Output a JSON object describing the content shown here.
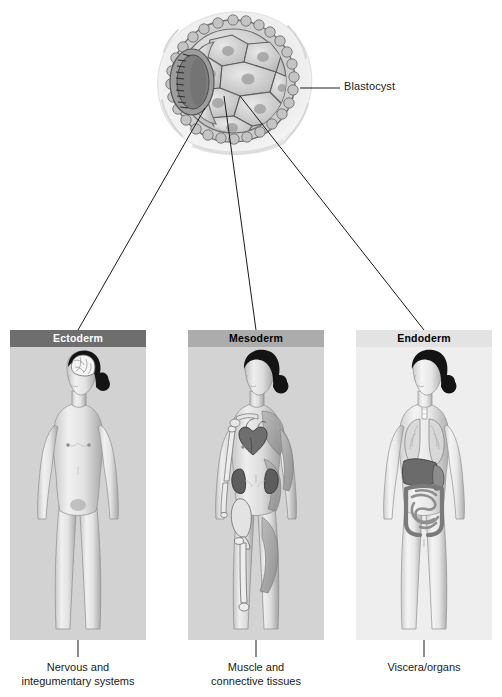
{
  "figure": {
    "background_color": "#ffffff"
  },
  "blastocyst": {
    "label": "Blastocyst",
    "icon": "blastocyst-illustration",
    "structures": [
      "trophoblast",
      "inner cell mass",
      "bilaminar embryonic disc",
      "blastocyst cavity"
    ]
  },
  "germ_layers": [
    {
      "id": "ectoderm",
      "header": "Ectoderm",
      "header_color": "#6e6e6e",
      "header_text_color": "#ffffff",
      "panel_color": "#d2d2d2",
      "figure_icon": "female-body-nervous-system",
      "highlighted_structures": [
        "brain"
      ],
      "caption_lines": [
        "Nervous and",
        "integumentary systems"
      ]
    },
    {
      "id": "mesoderm",
      "header": "Mesoderm",
      "header_color": "#acacac",
      "header_text_color": "#000000",
      "panel_color": "#d3d3d3",
      "figure_icon": "female-body-muscle-skeletal-system",
      "highlighted_structures": [
        "skeletal muscle",
        "heart",
        "kidneys",
        "bones",
        "pelvis",
        "femur"
      ],
      "caption_lines": [
        "Muscle and",
        "connective tissues"
      ]
    },
    {
      "id": "endoderm",
      "header": "Endoderm",
      "header_color": "#e3e3e3",
      "header_text_color": "#000000",
      "panel_color": "#eeeeee",
      "figure_icon": "female-body-visceral-organs",
      "highlighted_structures": [
        "trachea",
        "lungs",
        "liver",
        "stomach",
        "small intestine",
        "large intestine"
      ],
      "caption_lines": [
        "Viscera/organs"
      ]
    }
  ],
  "connectors": {
    "blastocyst_label_leader": "horizontal line from blastocyst trophoblast to label",
    "germ_layer_leaders": [
      "inner cell mass to Ectoderm panel",
      "inner cell mass to Mesoderm panel",
      "inner cell mass to Endoderm panel"
    ],
    "caption_leaders": [
      "Ectoderm panel to caption",
      "Mesoderm panel to caption",
      "Endoderm panel to caption"
    ],
    "line_color": "#1a1a1a"
  }
}
